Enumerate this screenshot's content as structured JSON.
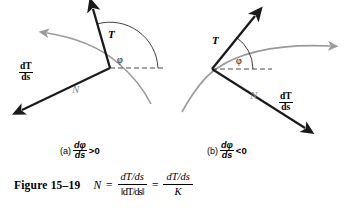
{
  "figure": {
    "number_label": "Figure 15–19",
    "equation": {
      "lhs": "N",
      "equals_1": "=",
      "frac1_num": "dT/ds",
      "frac1_den": "‖dT/ds‖",
      "equals_2": "=",
      "frac2_num": "dT/ds",
      "frac2_den": "K"
    }
  },
  "panels": [
    {
      "id": "a",
      "caption_paren": "(a)",
      "caption_frac_num": "dφ",
      "caption_frac_den": "ds",
      "caption_inequality": ">0",
      "labels": {
        "tangent": "T",
        "normal": "N",
        "derivative_num": "dT",
        "derivative_den": "ds",
        "angle": "φ"
      }
    },
    {
      "id": "b",
      "caption_paren": "(b)",
      "caption_frac_num": "dφ",
      "caption_frac_den": "ds",
      "caption_inequality": "<0",
      "labels": {
        "tangent": "T",
        "normal": "N",
        "derivative_num": "dT",
        "derivative_den": "ds",
        "angle": "φ"
      }
    }
  ],
  "colors": {
    "curve": "#9a9a9a",
    "vector": "#1a1a1a",
    "normal_label": "#8a8a8a",
    "background": "#ffffff"
  }
}
